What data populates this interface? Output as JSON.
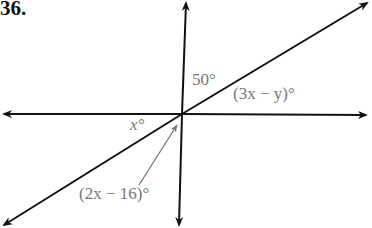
{
  "problem_number": "36.",
  "labels": {
    "angle_top": "50°",
    "angle_right": "(3x − y)°",
    "angle_left": "x°",
    "angle_bottom": "(2x − 16)°"
  },
  "colors": {
    "lines": "#111111",
    "labels": "#777777"
  }
}
